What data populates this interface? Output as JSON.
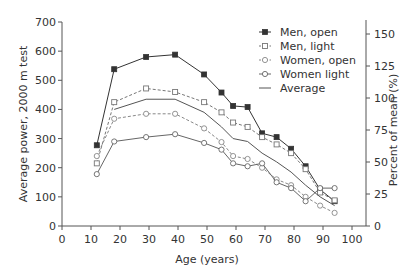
{
  "chart_data": {
    "type": "line",
    "title": "",
    "xlabel": "Age (years)",
    "ylabel": "Average power, 2000 m test",
    "y2label": "Percent of mean (%)",
    "xlim": [
      0,
      100
    ],
    "ylim": [
      0,
      700
    ],
    "y2lim": [
      0,
      150
    ],
    "xticks": [
      0,
      10,
      20,
      30,
      40,
      50,
      60,
      70,
      80,
      90,
      100
    ],
    "yticks": [
      0,
      100,
      200,
      300,
      400,
      500,
      600,
      700
    ],
    "y2ticks": [
      0,
      25,
      50,
      75,
      100,
      125,
      150
    ],
    "grid": false,
    "legend_position": "upper right",
    "x": [
      12,
      18,
      29,
      39,
      49,
      55,
      59,
      64,
      69,
      74,
      79,
      84,
      89,
      94
    ],
    "series": [
      {
        "name": "Men, open",
        "marker": "filled-square",
        "line": "solid",
        "values": [
          277,
          538,
          580,
          588,
          520,
          458,
          412,
          408,
          318,
          305,
          265,
          205,
          125,
          85
        ]
      },
      {
        "name": "Men, light",
        "marker": "open-square",
        "line": "dashed",
        "values": [
          215,
          425,
          472,
          460,
          425,
          390,
          355,
          340,
          305,
          280,
          250,
          195,
          115,
          88
        ]
      },
      {
        "name": "Women, open",
        "marker": "open-circle",
        "line": "dashed",
        "values": [
          240,
          368,
          385,
          385,
          335,
          288,
          240,
          230,
          200,
          160,
          140,
          100,
          70,
          45
        ]
      },
      {
        "name": "Women light",
        "marker": "open-circle",
        "line": "solid",
        "values": [
          178,
          290,
          305,
          315,
          285,
          262,
          215,
          205,
          215,
          150,
          130,
          85,
          130,
          130
        ]
      },
      {
        "name": "Average",
        "marker": "none",
        "line": "solid",
        "values": [
          null,
          400,
          435,
          435,
          390,
          340,
          300,
          290,
          250,
          220,
          185,
          140,
          100,
          70
        ]
      }
    ]
  },
  "legend": {
    "items": [
      {
        "label": "Men, open"
      },
      {
        "label": "Men, light"
      },
      {
        "label": "Women, open"
      },
      {
        "label": "Women light"
      },
      {
        "label": "Average"
      }
    ]
  },
  "colors": {
    "axis": "#555555",
    "men_open": "#333333",
    "men_light": "#777777",
    "women_open": "#888888",
    "women_light": "#666666",
    "average": "#555555"
  }
}
